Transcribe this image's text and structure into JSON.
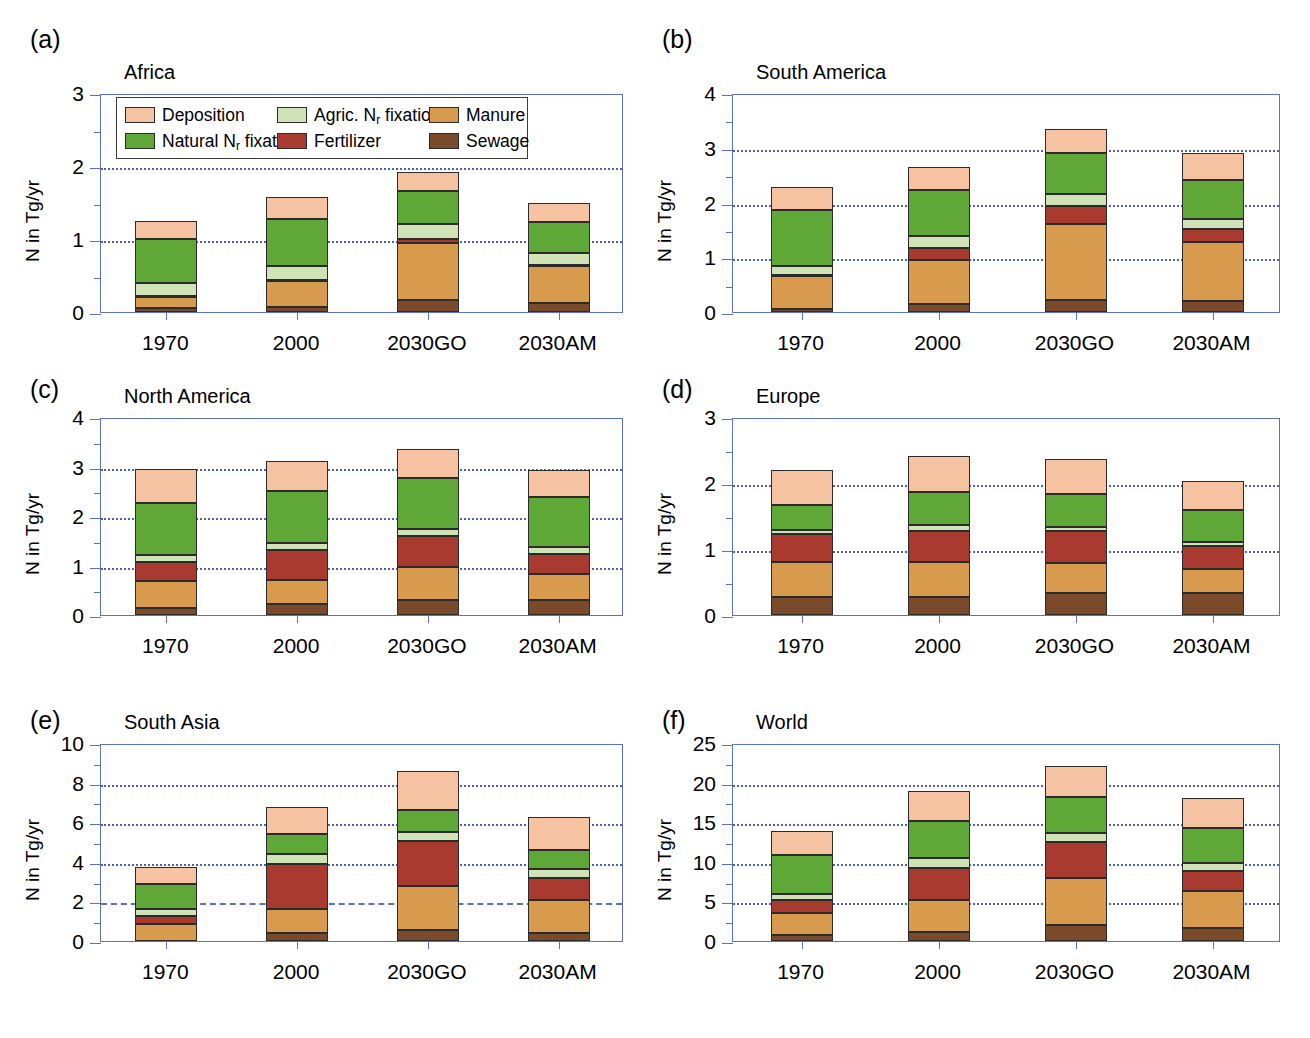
{
  "legend": {
    "position": "inside-panel-a-top",
    "entries": [
      {
        "label": "Deposition",
        "key": "deposition",
        "color": "#f5c2a2"
      },
      {
        "label": "Agric. N",
        "sub": "r",
        "label2": " fixation",
        "key": "agric_fixation",
        "color": "#cfe3b6"
      },
      {
        "label": "Manure",
        "key": "manure",
        "color": "#d89b4e"
      },
      {
        "label": "Natural N",
        "sub": "r",
        "label2": " fixation",
        "key": "natural_fixation",
        "color": "#5fa837"
      },
      {
        "label": "Fertilizer",
        "key": "fertilizer",
        "color": "#a93a30"
      },
      {
        "label": "Sewage",
        "key": "sewage",
        "color": "#7a4a2a"
      }
    ]
  },
  "colors": {
    "deposition": "#f5c2a2",
    "natural_fixation": "#5fa837",
    "agric_fixation": "#cfe3b6",
    "fertilizer": "#a93a30",
    "manure": "#d89b4e",
    "sewage": "#7a4a2a",
    "axis": "#5a72c4",
    "grid": "#4a62b8",
    "outline": "#2b2b2b"
  },
  "chart_data": [
    {
      "panel": "a",
      "panel_label": "(a)",
      "title": "Africa",
      "type": "bar",
      "stacked": true,
      "ylabel": "N in Tg/yr",
      "xlabel": "",
      "ylim": [
        0,
        3
      ],
      "yticks": [
        0,
        1,
        2,
        3
      ],
      "yminor_step": 0.5,
      "gridlines": [
        1,
        2
      ],
      "grid_style": "dotted",
      "categories": [
        "1970",
        "2000",
        "2030GO",
        "2030AM"
      ],
      "series": [
        {
          "name": "Sewage",
          "key": "sewage",
          "values": [
            0.05,
            0.07,
            0.17,
            0.12
          ]
        },
        {
          "name": "Manure",
          "key": "manure",
          "values": [
            0.16,
            0.36,
            0.78,
            0.51
          ]
        },
        {
          "name": "Fertilizer",
          "key": "fertilizer",
          "values": [
            0.01,
            0.01,
            0.05,
            0.01
          ]
        },
        {
          "name": "Agric. Nr fixation",
          "key": "agric_fixation",
          "values": [
            0.18,
            0.19,
            0.21,
            0.17
          ]
        },
        {
          "name": "Natural Nr fixation",
          "key": "natural_fixation",
          "values": [
            0.6,
            0.64,
            0.45,
            0.42
          ]
        },
        {
          "name": "Deposition",
          "key": "deposition",
          "values": [
            0.24,
            0.31,
            0.26,
            0.26
          ]
        }
      ],
      "totals": [
        1.24,
        1.58,
        1.92,
        1.49
      ]
    },
    {
      "panel": "b",
      "panel_label": "(b)",
      "title": "South America",
      "type": "bar",
      "stacked": true,
      "ylabel": "N in Tg/yr",
      "xlabel": "",
      "ylim": [
        0,
        4
      ],
      "yticks": [
        0,
        1,
        2,
        3,
        4
      ],
      "yminor_step": 0.5,
      "gridlines": [
        1,
        2,
        3
      ],
      "grid_style": "dotted",
      "categories": [
        "1970",
        "2000",
        "2030GO",
        "2030AM"
      ],
      "series": [
        {
          "name": "Sewage",
          "key": "sewage",
          "values": [
            0.06,
            0.14,
            0.22,
            0.2
          ]
        },
        {
          "name": "Manure",
          "key": "manure",
          "values": [
            0.6,
            0.81,
            1.39,
            1.07
          ]
        },
        {
          "name": "Fertilizer",
          "key": "fertilizer",
          "values": [
            0.01,
            0.22,
            0.32,
            0.24
          ]
        },
        {
          "name": "Agric. Nr fixation",
          "key": "agric_fixation",
          "values": [
            0.17,
            0.21,
            0.22,
            0.18
          ]
        },
        {
          "name": "Natural Nr fixation",
          "key": "natural_fixation",
          "values": [
            1.02,
            0.85,
            0.75,
            0.73
          ]
        },
        {
          "name": "Deposition",
          "key": "deposition",
          "values": [
            0.43,
            0.42,
            0.45,
            0.48
          ]
        }
      ],
      "totals": [
        2.29,
        2.65,
        3.35,
        2.9
      ]
    },
    {
      "panel": "c",
      "panel_label": "(c)",
      "title": "North America",
      "type": "bar",
      "stacked": true,
      "ylabel": "N in Tg/yr",
      "xlabel": "",
      "ylim": [
        0,
        4
      ],
      "yticks": [
        0,
        1,
        2,
        3,
        4
      ],
      "yminor_step": 0.5,
      "gridlines": [
        1,
        2,
        3
      ],
      "grid_style": "dotted",
      "categories": [
        "1970",
        "2000",
        "2030GO",
        "2030AM"
      ],
      "series": [
        {
          "name": "Sewage",
          "key": "sewage",
          "values": [
            0.14,
            0.22,
            0.31,
            0.3
          ]
        },
        {
          "name": "Manure",
          "key": "manure",
          "values": [
            0.55,
            0.49,
            0.65,
            0.52
          ]
        },
        {
          "name": "Fertilizer",
          "key": "fertilizer",
          "values": [
            0.39,
            0.6,
            0.63,
            0.41
          ]
        },
        {
          "name": "Agric. Nr fixation",
          "key": "agric_fixation",
          "values": [
            0.14,
            0.14,
            0.15,
            0.15
          ]
        },
        {
          "name": "Natural Nr fixation",
          "key": "natural_fixation",
          "values": [
            1.05,
            1.05,
            1.02,
            1.0
          ]
        },
        {
          "name": "Deposition",
          "key": "deposition",
          "values": [
            0.67,
            0.62,
            0.59,
            0.55
          ]
        }
      ],
      "totals": [
        2.94,
        3.12,
        3.35,
        2.93
      ]
    },
    {
      "panel": "d",
      "panel_label": "(d)",
      "title": "Europe",
      "type": "bar",
      "stacked": true,
      "ylabel": "N in Tg/yr",
      "xlabel": "",
      "ylim": [
        0,
        3
      ],
      "yticks": [
        0,
        1,
        2,
        3
      ],
      "yminor_step": 0.5,
      "gridlines": [
        1,
        2
      ],
      "grid_style": "dotted",
      "categories": [
        "1970",
        "2000",
        "2030GO",
        "2030AM"
      ],
      "series": [
        {
          "name": "Sewage",
          "key": "sewage",
          "values": [
            0.28,
            0.28,
            0.34,
            0.33
          ]
        },
        {
          "name": "Manure",
          "key": "manure",
          "values": [
            0.52,
            0.52,
            0.45,
            0.37
          ]
        },
        {
          "name": "Fertilizer",
          "key": "fertilizer",
          "values": [
            0.43,
            0.48,
            0.48,
            0.34
          ]
        },
        {
          "name": "Agric. Nr fixation",
          "key": "agric_fixation",
          "values": [
            0.06,
            0.08,
            0.07,
            0.07
          ]
        },
        {
          "name": "Natural Nr fixation",
          "key": "natural_fixation",
          "values": [
            0.38,
            0.5,
            0.49,
            0.48
          ]
        },
        {
          "name": "Deposition",
          "key": "deposition",
          "values": [
            0.52,
            0.55,
            0.53,
            0.44
          ]
        }
      ],
      "totals": [
        2.19,
        2.41,
        2.36,
        2.03
      ]
    },
    {
      "panel": "e",
      "panel_label": "(e)",
      "title": "South Asia",
      "type": "bar",
      "stacked": true,
      "ylabel": "N in Tg/yr",
      "xlabel": "",
      "ylim": [
        0,
        10
      ],
      "yticks": [
        0,
        2,
        4,
        6,
        8,
        10
      ],
      "yminor_step": 1,
      "gridlines": [
        4,
        6,
        8
      ],
      "dashed_gridlines": [
        2
      ],
      "grid_style": "dotted",
      "categories": [
        "1970",
        "2000",
        "2030GO",
        "2030AM"
      ],
      "series": [
        {
          "name": "Sewage",
          "key": "sewage",
          "values": [
            0.02,
            0.4,
            0.55,
            0.42
          ]
        },
        {
          "name": "Manure",
          "key": "manure",
          "values": [
            0.83,
            1.2,
            2.22,
            1.63
          ]
        },
        {
          "name": "Fertilizer",
          "key": "fertilizer",
          "values": [
            0.4,
            2.3,
            2.3,
            1.13
          ]
        },
        {
          "name": "Agric. Nr fixation",
          "key": "agric_fixation",
          "values": [
            0.37,
            0.5,
            0.45,
            0.45
          ]
        },
        {
          "name": "Natural Nr fixation",
          "key": "natural_fixation",
          "values": [
            1.24,
            1.0,
            1.12,
            0.95
          ]
        },
        {
          "name": "Deposition",
          "key": "deposition",
          "values": [
            0.89,
            1.37,
            1.94,
            1.7
          ]
        }
      ],
      "totals": [
        3.75,
        6.77,
        8.58,
        6.28
      ]
    },
    {
      "panel": "f",
      "panel_label": "(f)",
      "title": "World",
      "type": "bar",
      "stacked": true,
      "ylabel": "N in Tg/yr",
      "xlabel": "",
      "ylim": [
        0,
        25
      ],
      "yticks": [
        0,
        5,
        10,
        15,
        20,
        25
      ],
      "yminor_step": 2.5,
      "gridlines": [
        5,
        10,
        15,
        20
      ],
      "grid_style": "dotted",
      "categories": [
        "1970",
        "2000",
        "2030GO",
        "2030AM"
      ],
      "series": [
        {
          "name": "Sewage",
          "key": "sewage",
          "values": [
            0.8,
            1.2,
            2.0,
            1.6
          ]
        },
        {
          "name": "Manure",
          "key": "manure",
          "values": [
            2.8,
            4.0,
            6.0,
            4.7
          ]
        },
        {
          "name": "Fertilizer",
          "key": "fertilizer",
          "values": [
            1.6,
            4.0,
            4.5,
            2.5
          ]
        },
        {
          "name": "Agric. Nr fixation",
          "key": "agric_fixation",
          "values": [
            0.7,
            1.3,
            1.2,
            1.0
          ]
        },
        {
          "name": "Natural Nr fixation",
          "key": "natural_fixation",
          "values": [
            4.9,
            4.7,
            4.5,
            4.5
          ]
        },
        {
          "name": "Deposition",
          "key": "deposition",
          "values": [
            3.1,
            3.8,
            3.9,
            3.7
          ]
        }
      ],
      "totals": [
        13.9,
        19.0,
        22.1,
        18.0
      ]
    }
  ]
}
